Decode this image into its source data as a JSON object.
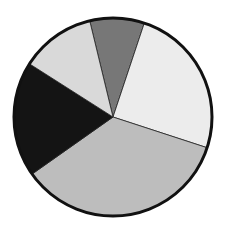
{
  "chart_data": {
    "type": "pie",
    "title": "",
    "legend": [],
    "center": [
      113,
      117
    ],
    "radius": 99,
    "start_angle_deg": 346.4,
    "slices": [
      {
        "label": "",
        "value": 8.9,
        "color": "#777777"
      },
      {
        "label": "",
        "value": 24.9,
        "color": "#ececec"
      },
      {
        "label": "",
        "value": 35.2,
        "color": "#bdbdbd"
      },
      {
        "label": "",
        "value": 18.8,
        "color": "#141414"
      },
      {
        "label": "",
        "value": 12.2,
        "color": "#d9d9d9"
      }
    ],
    "values": [
      8.9,
      24.9,
      35.2,
      18.8,
      12.2
    ]
  }
}
